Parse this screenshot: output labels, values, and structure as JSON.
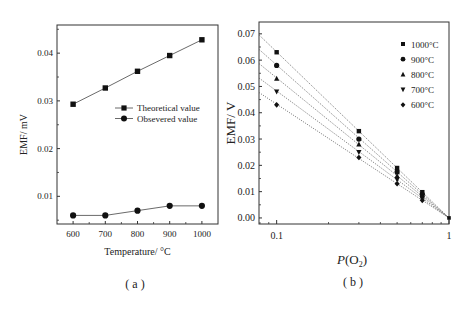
{
  "chart_data": [
    {
      "type": "line",
      "panel_label": "( a )",
      "title": "",
      "xlabel": "Temperature/ °C",
      "ylabel": "EMF/ mV",
      "x": [
        600,
        700,
        800,
        900,
        1000
      ],
      "xlim": [
        550,
        1050
      ],
      "ylim": [
        0.0042,
        0.0459
      ],
      "xticks": [
        600,
        700,
        800,
        900,
        1000
      ],
      "xtick_labels": [
        "600",
        "700",
        "800",
        "900",
        "1000"
      ],
      "yticks": [
        0.01,
        0.02,
        0.03,
        0.04
      ],
      "ytick_labels": [
        "0.01",
        "0.02",
        "0.03",
        "0.04"
      ],
      "grid": false,
      "legend_position": "center-right",
      "series": [
        {
          "name": "Theoretical value",
          "marker": "square",
          "values": [
            0.0293,
            0.0327,
            0.0362,
            0.0395,
            0.0428
          ]
        },
        {
          "name": "Obsevered value",
          "marker": "circle",
          "values": [
            0.006,
            0.006,
            0.007,
            0.008,
            0.008
          ]
        }
      ]
    },
    {
      "type": "scatter",
      "panel_label": "( b )",
      "title": "",
      "xlabel": "P(O2)",
      "xlabel_main": "P",
      "xlabel_paren_open": "(O",
      "xlabel_sub": "2",
      "xlabel_paren_close": ")",
      "ylabel": "EMF/ V",
      "xscale": "log",
      "xlim": [
        0.079,
        1.0
      ],
      "ylim": [
        -0.0023,
        0.0745
      ],
      "xticks": [
        0.1,
        1
      ],
      "xtick_labels": [
        "0.1",
        "1"
      ],
      "yticks": [
        0.0,
        0.01,
        0.02,
        0.03,
        0.04,
        0.05,
        0.06,
        0.07
      ],
      "ytick_labels": [
        "0.00",
        "0.01",
        "0.02",
        "0.03",
        "0.04",
        "0.05",
        "0.06",
        "0.07"
      ],
      "grid": false,
      "legend_position": "top-right",
      "fit_lines": "dotted, extended from left axis to P(O2)=1",
      "x": [
        0.1,
        0.3,
        0.5,
        0.7
      ],
      "series": [
        {
          "name": "1000°C",
          "marker": "square",
          "values": [
            0.063,
            0.033,
            0.019,
            0.0098
          ],
          "fit_at_xmin": 0.0696
        },
        {
          "name": "900°C",
          "marker": "circle",
          "values": [
            0.058,
            0.03,
            0.0175,
            0.009
          ],
          "fit_at_xmin": 0.0641
        },
        {
          "name": "800°C",
          "marker": "triangle-up",
          "values": [
            0.053,
            0.028,
            0.016,
            0.0082
          ],
          "fit_at_xmin": 0.0587
        },
        {
          "name": "700°C",
          "marker": "triangle-down",
          "values": [
            0.048,
            0.025,
            0.0145,
            0.0075
          ],
          "fit_at_xmin": 0.0532
        },
        {
          "name": "600°C",
          "marker": "diamond",
          "values": [
            0.043,
            0.023,
            0.013,
            0.0067
          ],
          "fit_at_xmin": 0.0477
        }
      ]
    }
  ]
}
